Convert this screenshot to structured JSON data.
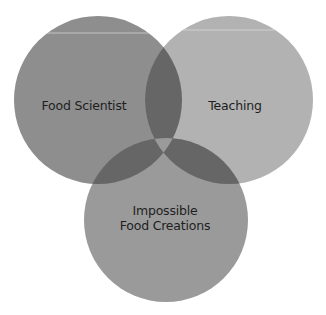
{
  "diagram": {
    "type": "venn",
    "sets": [
      {
        "id": "left",
        "label": "Food Scientist",
        "cx": 98,
        "cy": 100,
        "r": 84,
        "color": "#8e8e8e",
        "label_x": 84,
        "label_y": 105
      },
      {
        "id": "right",
        "label": "Teaching",
        "cx": 229,
        "cy": 100,
        "r": 84,
        "color": "#b2b2b2",
        "label_x": 235,
        "label_y": 105
      },
      {
        "id": "bottom",
        "label_line1": "Impossible",
        "label_line2": "Food Creations",
        "cx": 166,
        "cy": 220,
        "r": 82,
        "color": "#9a9a9a",
        "label_x": 165,
        "label_y": 218
      }
    ],
    "overlap_color": "#666666",
    "triple_overlap_color": "#9a9a9a",
    "highlight_line_color": "#d8d8d8"
  }
}
